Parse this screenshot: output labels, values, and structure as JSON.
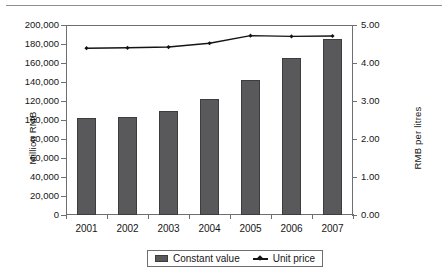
{
  "chart_data": {
    "type": "bar",
    "title": "",
    "subtitle": "",
    "xlabel": "",
    "ylabel": "Million RMB",
    "y2label": "RMB per litres",
    "categories": [
      "2001",
      "2002",
      "2003",
      "2004",
      "2005",
      "2006",
      "2007"
    ],
    "series": [
      {
        "name": "Constant value",
        "type": "bar",
        "axis": "left",
        "unit": "Million RMB",
        "color": "#59595b",
        "values": [
          102000,
          103500,
          110000,
          122000,
          142000,
          165000,
          185000
        ]
      },
      {
        "name": "Unit price",
        "type": "line",
        "axis": "right",
        "unit": "RMB per litres",
        "color": "#141414",
        "marker": "diamond",
        "values": [
          4.39,
          4.4,
          4.42,
          4.52,
          4.72,
          4.7,
          4.71
        ]
      }
    ],
    "ylim": [
      0,
      200000
    ],
    "y2lim": [
      0,
      5.0
    ],
    "ytick_step": 20000,
    "y2tick_step": 1.0,
    "yticks": [
      "0",
      "20,000",
      "40,000",
      "60,000",
      "80,000",
      "100,000",
      "120,000",
      "140,000",
      "160,000",
      "180,000",
      "200,000"
    ],
    "y2ticks": [
      "0.00",
      "1.00",
      "2.00",
      "3.00",
      "4.00",
      "5.00"
    ],
    "grid": false,
    "legend_position": "bottom",
    "legend_entries": [
      "Constant value",
      "Unit price"
    ]
  }
}
